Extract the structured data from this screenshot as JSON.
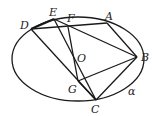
{
  "diagram": {
    "shape": "ellipse",
    "stroke_color": "#1a1a1a",
    "points": {
      "D": {
        "label": "D",
        "x": 31,
        "y": 29
      },
      "E": {
        "label": "E",
        "x": 54,
        "y": 19
      },
      "F": {
        "label": "F",
        "x": 68,
        "y": 27
      },
      "A": {
        "label": "A",
        "x": 107,
        "y": 23
      },
      "B": {
        "label": "B",
        "x": 137,
        "y": 57
      },
      "O": {
        "label": "O",
        "x": 74,
        "y": 58
      },
      "G": {
        "label": "G",
        "x": 78,
        "y": 81
      },
      "C": {
        "label": "C",
        "x": 96,
        "y": 100
      }
    },
    "curve_label": "α",
    "segments": [
      "D-A",
      "D-E",
      "E-B",
      "A-B",
      "D-C",
      "E-C",
      "F-G",
      "G-B",
      "B-C",
      "F-C"
    ]
  }
}
